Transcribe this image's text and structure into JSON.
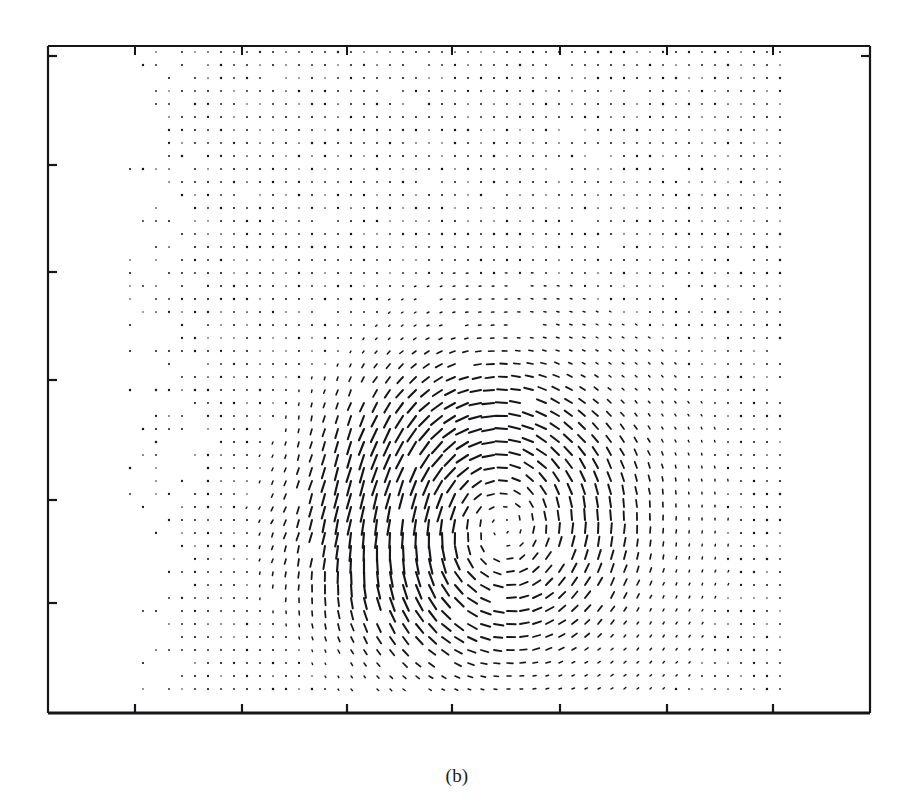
{
  "figure": {
    "caption": "(b)",
    "type": "vector-field-quiver-plot",
    "background_color": "#ffffff",
    "ink_color": "#16161a"
  },
  "axes": {
    "frame": {
      "left": 48,
      "top": 46,
      "right": 870,
      "bottom": 713
    },
    "frame_line_width": 2.2,
    "tick_length": 9,
    "x_ticks": [
      135,
      242,
      347,
      452,
      560,
      667,
      773
    ],
    "y_ticks": [
      56,
      165,
      272,
      380,
      500,
      603
    ],
    "x_tick_labels": [],
    "y_tick_labels": [],
    "grid": false
  },
  "chart_data": {
    "type": "scatter",
    "subtype": "quiver",
    "title": "",
    "subtitle": "",
    "xlabel": "",
    "ylabel": "",
    "legend": [],
    "grid": false,
    "xlim": [
      0,
      63
    ],
    "ylim": [
      0,
      51
    ],
    "grid_spacing_px": 13,
    "vector_scale_px": 11,
    "field_origin_px": {
      "x": 130,
      "y": 52
    },
    "field_cols": 50,
    "field_rows": 50,
    "flow_features": [
      {
        "name": "primary-vortex",
        "center_px": {
          "x": 470,
          "y": 495
        },
        "radius_px": 120,
        "circulation": -1.0,
        "peak_magnitude": 1.0
      },
      {
        "name": "secondary-vortex",
        "center_px": {
          "x": 330,
          "y": 470
        },
        "radius_px": 95,
        "circulation": 0.55,
        "peak_magnitude": 0.72
      },
      {
        "name": "lower-downflow-jet",
        "center_px": {
          "x": 520,
          "y": 620
        },
        "radius_px": 110,
        "circulation": -0.45,
        "peak_magnitude": 0.8
      },
      {
        "name": "upper-left-eddy",
        "center_px": {
          "x": 250,
          "y": 180
        },
        "radius_px": 70,
        "circulation": 0.3,
        "peak_magnitude": 0.28
      },
      {
        "name": "upper-right-eddy",
        "center_px": {
          "x": 700,
          "y": 150
        },
        "radius_px": 75,
        "circulation": -0.28,
        "peak_magnitude": 0.26
      },
      {
        "name": "right-shear-band",
        "center_px": {
          "x": 660,
          "y": 470
        },
        "radius_px": 130,
        "circulation": -0.35,
        "peak_magnitude": 0.42
      },
      {
        "name": "left-lower-patch",
        "center_px": {
          "x": 165,
          "y": 620
        },
        "radius_px": 70,
        "circulation": 0.25,
        "peak_magnitude": 0.35
      }
    ],
    "active_region_px": {
      "x0": 130,
      "y0": 52,
      "x1": 790,
      "y1": 700
    }
  }
}
